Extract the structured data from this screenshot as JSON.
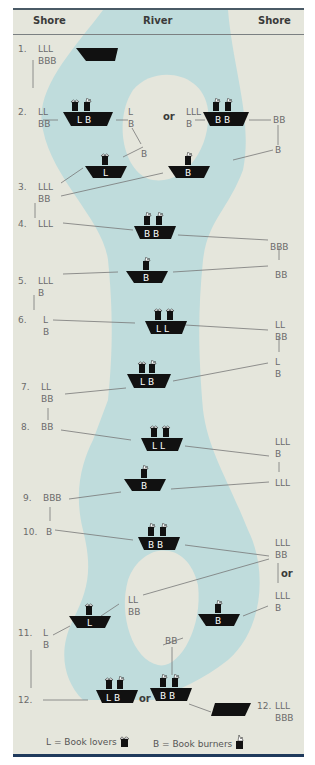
{
  "header": {
    "left": "Shore",
    "center": "River",
    "right": "Shore"
  },
  "steps": [
    {
      "n": "1.",
      "left": "LLL\nBBB"
    },
    {
      "n": "2.",
      "left": "LL\nBB",
      "boat_a": "L B",
      "island_a": "L\nB",
      "or": "or",
      "island_b": "LLL\nB",
      "boat_b": "B B",
      "right": "BB",
      "island_c": "B",
      "right_b": "B"
    },
    {
      "n": "3.",
      "left": "LLL\nBB",
      "boat_a": "L",
      "boat_b": "B"
    },
    {
      "n": "4.",
      "left": "LLL",
      "boat": "B B",
      "right": "BBB"
    },
    {
      "n": "5.",
      "left": "LLL\nB",
      "boat": "B",
      "right": "BB"
    },
    {
      "n": "6.",
      "left": "L\nB",
      "boat": "L L",
      "right": "LL\nBB"
    },
    {
      "n": "7.",
      "left": "LL\nBB",
      "boat": "L B",
      "right": "L\nB"
    },
    {
      "n": "8.",
      "left": "BB",
      "boat": "L L",
      "right": "LLL\nB"
    },
    {
      "n": "9.",
      "left": "BBB",
      "boat": "B",
      "right": "LLL"
    },
    {
      "n": "10.",
      "left": "B",
      "boat": "B B",
      "right": "LLL\nBB",
      "or": "or",
      "right_b": "LLL\nB"
    },
    {
      "n": "11.",
      "left": "L\nB",
      "boat_a": "L",
      "island_a": "LL\nBB",
      "boat_b": "B",
      "island_b": "BB"
    },
    {
      "n": "12.",
      "boat_a": "L B",
      "or": "or",
      "boat_b": "B B",
      "right_n": "12.",
      "right": "LLL\nBBB"
    }
  ],
  "legend": {
    "lovers": "L = Book lovers",
    "burners": "B = Book burners"
  },
  "colors": {
    "shore": "#e5e6dc",
    "river": "#bfdcdc",
    "boat": "#111111",
    "border": "#1f3a5c"
  }
}
